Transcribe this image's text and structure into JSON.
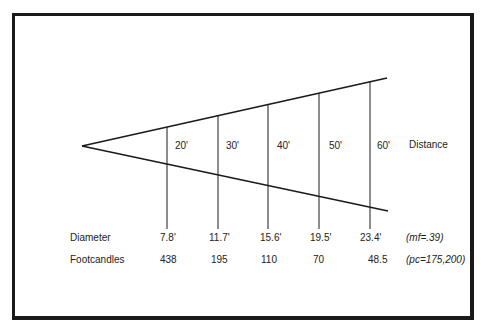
{
  "figure": {
    "apex": {
      "x": 82,
      "y": 146
    },
    "top_end": {
      "x": 387,
      "y": 78
    },
    "bottom_end": {
      "x": 388,
      "y": 211
    },
    "line_color": "#1a1a1a"
  },
  "distance": {
    "label": "Distance",
    "values": [
      "20'",
      "30'",
      "40'",
      "50'",
      "60'"
    ]
  },
  "rows": {
    "diameter": {
      "label": "Diameter",
      "values": [
        "7.8'",
        "11.7'",
        "15.6'",
        "19.5'",
        "23.4'"
      ],
      "note": "(mf=.39)"
    },
    "footcandles": {
      "label": "Footcandles",
      "values": [
        "438",
        "195",
        "110",
        "70",
        "48.5"
      ],
      "note": "(pc=175,200)"
    }
  }
}
